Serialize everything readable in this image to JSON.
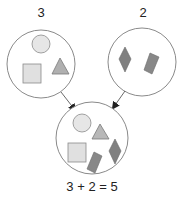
{
  "diagram": {
    "left_group": {
      "label": "3",
      "count": 3,
      "shapes": [
        "circle",
        "square",
        "triangle"
      ]
    },
    "right_group": {
      "label": "2",
      "count": 2,
      "shapes": [
        "diamond",
        "rectangle"
      ]
    },
    "result_group": {
      "count": 5,
      "shapes": [
        "circle",
        "triangle",
        "square",
        "rectangle",
        "diamond"
      ]
    },
    "equation": "3 + 2 = 5"
  },
  "colors": {
    "outline": "#8a8a8a",
    "light_fill": "#e0e0e0",
    "mid_fill": "#a8a8a8",
    "dark_fill": "#7a7a7a",
    "text": "#222222"
  }
}
